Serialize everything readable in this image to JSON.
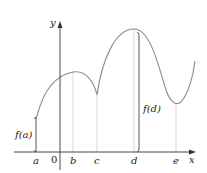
{
  "diagram": {
    "axes": {
      "x_label": "x",
      "y_label": "y",
      "origin_label": "0"
    },
    "ticks": [
      {
        "label": "a",
        "x": 36
      },
      {
        "label": "b",
        "x": 73
      },
      {
        "label": "c",
        "x": 97
      },
      {
        "label": "d",
        "x": 134
      },
      {
        "label": "e",
        "x": 176
      }
    ],
    "annotations": {
      "fa": "f(a)",
      "fd": "f(d)"
    },
    "colors": {
      "curve": "#8a8a8a",
      "axis": "#333333",
      "guide": "#cccccc",
      "text": "#222222"
    }
  }
}
